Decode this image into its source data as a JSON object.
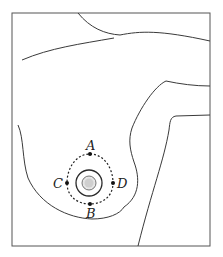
{
  "diagram": {
    "type": "anatomical-illustration",
    "colors": {
      "stroke": "#3a3a3a",
      "frame": "#555555",
      "nipple_fill": "#cfcfcf",
      "background": "#ffffff"
    },
    "points": [
      {
        "id": "A",
        "label": "A",
        "position": "top"
      },
      {
        "id": "B",
        "label": "B",
        "position": "bottom"
      },
      {
        "id": "C",
        "label": "C",
        "position": "left"
      },
      {
        "id": "D",
        "label": "D",
        "position": "right"
      }
    ],
    "labels": {
      "a": "A",
      "b": "B",
      "c": "C",
      "d": "D"
    }
  }
}
